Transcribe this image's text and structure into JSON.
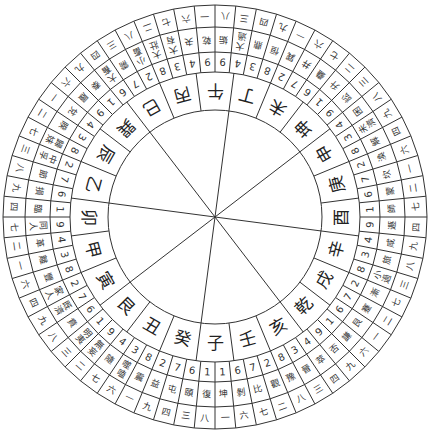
{
  "diagram": {
    "title": "",
    "center": [
      215,
      217
    ],
    "radii": {
      "hub": 107,
      "mountain_outer": 145,
      "number_outer": 165,
      "name_outer": 190,
      "outer": 212
    },
    "orientation": "south-up (子 at bottom)",
    "line_color": "#333333",
    "text_color": "#222222",
    "center_spokes": 8,
    "mountains": [
      "子",
      "癸",
      "丑",
      "艮",
      "寅",
      "甲",
      "卯",
      "乙",
      "辰",
      "巽",
      "巳",
      "丙",
      "午",
      "丁",
      "未",
      "坤",
      "申",
      "庚",
      "酉",
      "辛",
      "戌",
      "乾",
      "亥",
      "壬"
    ],
    "hexagrams": [
      {
        "name": "復",
        "num": "1",
        "yun": "八"
      },
      {
        "name": "頤",
        "num": "6",
        "yun": "三"
      },
      {
        "name": "屯",
        "num": "7",
        "yun": "四"
      },
      {
        "name": "益",
        "num": "2",
        "yun": "九"
      },
      {
        "name": "震",
        "num": "8",
        "yun": "一"
      },
      {
        "name": "噬嗑",
        "num": "3",
        "yun": "六"
      },
      {
        "name": "隨",
        "num": "4",
        "yun": "七"
      },
      {
        "name": "無妄",
        "num": "9",
        "yun": "二"
      },
      {
        "name": "明夷",
        "num": "1",
        "yun": "三"
      },
      {
        "name": "賁",
        "num": "6",
        "yun": "八"
      },
      {
        "name": "既濟",
        "num": "7",
        "yun": "九"
      },
      {
        "name": "家人",
        "num": "2",
        "yun": "四"
      },
      {
        "name": "豐",
        "num": "8",
        "yun": "六"
      },
      {
        "name": "離",
        "num": "3",
        "yun": "一"
      },
      {
        "name": "革",
        "num": "4",
        "yun": "二"
      },
      {
        "name": "同人",
        "num": "9",
        "yun": "七"
      },
      {
        "name": "臨",
        "num": "1",
        "yun": "四"
      },
      {
        "name": "損",
        "num": "6",
        "yun": "九"
      },
      {
        "name": "節",
        "num": "7",
        "yun": "八"
      },
      {
        "name": "中孚",
        "num": "2",
        "yun": "三"
      },
      {
        "name": "歸妹",
        "num": "8",
        "yun": "七"
      },
      {
        "name": "睽",
        "num": "3",
        "yun": "二"
      },
      {
        "name": "兌",
        "num": "4",
        "yun": "一"
      },
      {
        "name": "履",
        "num": "9",
        "yun": "六"
      },
      {
        "name": "泰",
        "num": "1",
        "yun": "九"
      },
      {
        "name": "大畜",
        "num": "6",
        "yun": "四"
      },
      {
        "name": "需",
        "num": "7",
        "yun": "三"
      },
      {
        "name": "小畜",
        "num": "2",
        "yun": "八"
      },
      {
        "name": "大壯",
        "num": "8",
        "yun": "二"
      },
      {
        "name": "大有",
        "num": "3",
        "yun": "七"
      },
      {
        "name": "夬",
        "num": "4",
        "yun": "六"
      },
      {
        "name": "乾",
        "num": "9",
        "yun": "一"
      },
      {
        "name": "姤",
        "num": "9",
        "yun": "八"
      },
      {
        "name": "大過",
        "num": "4",
        "yun": "三"
      },
      {
        "name": "鼎",
        "num": "3",
        "yun": "四"
      },
      {
        "name": "恒",
        "num": "8",
        "yun": "九"
      },
      {
        "name": "巽",
        "num": "2",
        "yun": "一"
      },
      {
        "name": "井",
        "num": "7",
        "yun": "六"
      },
      {
        "name": "蠱",
        "num": "6",
        "yun": "七"
      },
      {
        "name": "升",
        "num": "1",
        "yun": "二"
      },
      {
        "name": "訟",
        "num": "9",
        "yun": "三"
      },
      {
        "name": "困",
        "num": "4",
        "yun": "八"
      },
      {
        "name": "未濟",
        "num": "3",
        "yun": "九"
      },
      {
        "name": "解",
        "num": "8",
        "yun": "四"
      },
      {
        "name": "渙",
        "num": "2",
        "yun": "六"
      },
      {
        "name": "坎",
        "num": "7",
        "yun": "一"
      },
      {
        "name": "蒙",
        "num": "6",
        "yun": "二"
      },
      {
        "name": "師",
        "num": "1",
        "yun": "七"
      },
      {
        "name": "遯",
        "num": "9",
        "yun": "四"
      },
      {
        "name": "咸",
        "num": "4",
        "yun": "九"
      },
      {
        "name": "旅",
        "num": "3",
        "yun": "八"
      },
      {
        "name": "小過",
        "num": "8",
        "yun": "三"
      },
      {
        "name": "漸",
        "num": "2",
        "yun": "七"
      },
      {
        "name": "蹇",
        "num": "7",
        "yun": "二"
      },
      {
        "name": "艮",
        "num": "6",
        "yun": "一"
      },
      {
        "name": "謙",
        "num": "1",
        "yun": "六"
      },
      {
        "name": "否",
        "num": "9",
        "yun": "九"
      },
      {
        "name": "萃",
        "num": "4",
        "yun": "四"
      },
      {
        "name": "晉",
        "num": "3",
        "yun": "三"
      },
      {
        "name": "豫",
        "num": "8",
        "yun": "八"
      },
      {
        "name": "觀",
        "num": "2",
        "yun": "二"
      },
      {
        "name": "比",
        "num": "7",
        "yun": "七"
      },
      {
        "name": "剝",
        "num": "6",
        "yun": "六"
      },
      {
        "name": "坤",
        "num": "1",
        "yun": "一"
      }
    ]
  }
}
